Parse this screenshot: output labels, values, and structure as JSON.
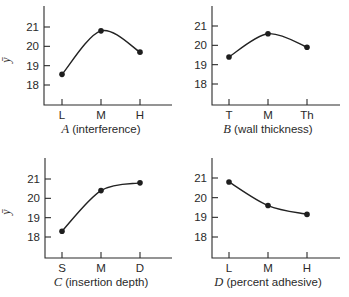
{
  "chart_data": [
    {
      "type": "line",
      "panel": "top-left",
      "factor": "A",
      "title": "",
      "xlabel": "A (interference)",
      "xlabel_var": "A",
      "xlabel_desc": "(interference)",
      "ylabel": "ȳ",
      "categories": [
        "L",
        "M",
        "H"
      ],
      "values": [
        18.55,
        20.8,
        19.7
      ],
      "yticks": [
        18,
        19,
        20,
        21
      ],
      "ylim": [
        17.0,
        22.3
      ],
      "grid": false,
      "legend": null
    },
    {
      "type": "line",
      "panel": "top-right",
      "factor": "B",
      "title": "",
      "xlabel": "B (wall thickness)",
      "xlabel_var": "B",
      "xlabel_desc": "(wall thickness)",
      "ylabel": "",
      "categories": [
        "T",
        "M",
        "Th"
      ],
      "values": [
        19.4,
        20.6,
        19.9
      ],
      "yticks": [
        18,
        19,
        20,
        21
      ],
      "ylim": [
        17.0,
        22.3
      ],
      "grid": false,
      "legend": null
    },
    {
      "type": "line",
      "panel": "bottom-left",
      "factor": "C",
      "title": "",
      "xlabel": "C (insertion depth)",
      "xlabel_var": "C",
      "xlabel_desc": "(insertion depth)",
      "ylabel": "ȳ",
      "categories": [
        "S",
        "M",
        "D"
      ],
      "values": [
        18.3,
        20.4,
        20.8
      ],
      "yticks": [
        18,
        19,
        20,
        21
      ],
      "ylim": [
        17.0,
        22.3
      ],
      "grid": false,
      "legend": null
    },
    {
      "type": "line",
      "panel": "bottom-right",
      "factor": "D",
      "title": "",
      "xlabel": "D (percent adhesive)",
      "xlabel_var": "D",
      "xlabel_desc": "(percent adhesive)",
      "ylabel": "",
      "categories": [
        "L",
        "M",
        "H"
      ],
      "values": [
        20.8,
        19.6,
        19.15
      ],
      "yticks": [
        18,
        19,
        20,
        21
      ],
      "ylim": [
        17.0,
        22.3
      ],
      "grid": false,
      "legend": null
    }
  ],
  "ylabel_symbol": "ȳ",
  "colors": {
    "ink": "#2a2a2a",
    "background": "#ffffff"
  }
}
